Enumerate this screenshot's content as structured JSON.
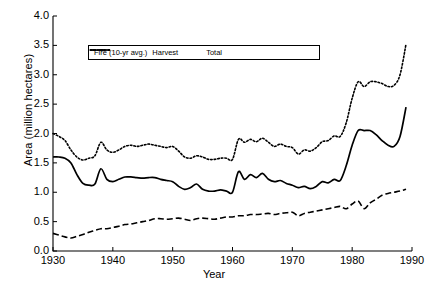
{
  "chart_data": {
    "type": "line",
    "title": "",
    "xlabel": "Year",
    "ylabel": "Area (million hectares)",
    "xlim": [
      1930,
      1990
    ],
    "ylim": [
      0.0,
      4.0
    ],
    "xticks": [
      1930,
      1940,
      1950,
      1960,
      1970,
      1980,
      1990
    ],
    "yticks": [
      "0.0",
      "0.5",
      "1.0",
      "1.5",
      "2.0",
      "2.5",
      "3.0",
      "3.5",
      "4.0"
    ],
    "grid": false,
    "legend_position": "upper-left-inside",
    "x": [
      1930,
      1931,
      1932,
      1933,
      1934,
      1935,
      1936,
      1937,
      1938,
      1939,
      1940,
      1941,
      1942,
      1943,
      1944,
      1945,
      1946,
      1947,
      1948,
      1949,
      1950,
      1951,
      1952,
      1953,
      1954,
      1955,
      1956,
      1957,
      1958,
      1959,
      1960,
      1961,
      1962,
      1963,
      1964,
      1965,
      1966,
      1967,
      1968,
      1969,
      1970,
      1971,
      1972,
      1973,
      1974,
      1975,
      1976,
      1977,
      1978,
      1979,
      1980,
      1981,
      1982,
      1983,
      1984,
      1985,
      1986,
      1987,
      1988,
      1989
    ],
    "series": [
      {
        "name": "Fire (10-yr avg.)",
        "style": "solid",
        "values": [
          1.6,
          1.6,
          1.58,
          1.5,
          1.3,
          1.15,
          1.12,
          1.14,
          1.4,
          1.22,
          1.18,
          1.22,
          1.26,
          1.26,
          1.25,
          1.24,
          1.25,
          1.25,
          1.22,
          1.2,
          1.18,
          1.1,
          1.05,
          1.08,
          1.14,
          1.05,
          1.02,
          1.02,
          1.04,
          1.02,
          1.0,
          1.35,
          1.22,
          1.3,
          1.25,
          1.32,
          1.22,
          1.18,
          1.2,
          1.15,
          1.12,
          1.08,
          1.1,
          1.06,
          1.1,
          1.18,
          1.16,
          1.22,
          1.2,
          1.45,
          1.8,
          2.05,
          2.05,
          2.05,
          1.98,
          1.88,
          1.8,
          1.78,
          1.95,
          2.45
        ]
      },
      {
        "name": "Harvest",
        "style": "dashed",
        "values": [
          0.3,
          0.27,
          0.24,
          0.22,
          0.25,
          0.28,
          0.32,
          0.35,
          0.38,
          0.38,
          0.4,
          0.42,
          0.45,
          0.46,
          0.48,
          0.5,
          0.52,
          0.55,
          0.55,
          0.54,
          0.55,
          0.56,
          0.54,
          0.52,
          0.55,
          0.56,
          0.55,
          0.54,
          0.56,
          0.58,
          0.58,
          0.6,
          0.6,
          0.62,
          0.62,
          0.63,
          0.64,
          0.62,
          0.64,
          0.65,
          0.66,
          0.6,
          0.64,
          0.66,
          0.68,
          0.7,
          0.72,
          0.74,
          0.76,
          0.72,
          0.8,
          0.85,
          0.72,
          0.82,
          0.88,
          0.95,
          0.98,
          1.0,
          1.02,
          1.05
        ]
      },
      {
        "name": "Total",
        "style": "dotted",
        "values": [
          2.0,
          1.95,
          1.88,
          1.72,
          1.6,
          1.55,
          1.58,
          1.62,
          1.85,
          1.72,
          1.68,
          1.72,
          1.78,
          1.8,
          1.78,
          1.8,
          1.82,
          1.8,
          1.78,
          1.76,
          1.78,
          1.7,
          1.6,
          1.58,
          1.62,
          1.6,
          1.56,
          1.56,
          1.58,
          1.58,
          1.56,
          1.9,
          1.85,
          1.9,
          1.86,
          1.92,
          1.85,
          1.78,
          1.82,
          1.78,
          1.76,
          1.65,
          1.72,
          1.7,
          1.76,
          1.86,
          1.88,
          1.96,
          1.95,
          2.18,
          2.6,
          2.88,
          2.8,
          2.88,
          2.88,
          2.85,
          2.8,
          2.82,
          3.0,
          3.52
        ]
      }
    ]
  },
  "legend": {
    "items": [
      {
        "label": "Fire (10-yr avg.)",
        "style": "solid"
      },
      {
        "label": "Harvest",
        "style": "dashed"
      },
      {
        "label": "Total",
        "style": "dotted"
      }
    ]
  }
}
